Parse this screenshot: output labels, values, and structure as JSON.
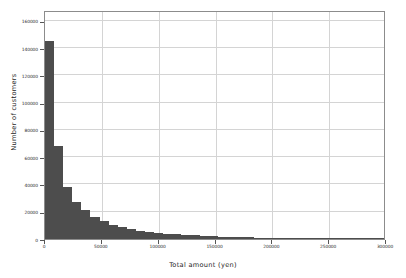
{
  "chart_data": {
    "type": "bar",
    "title": "",
    "subtitle": "",
    "xlabel": "Total amount (yen)",
    "ylabel": "Number of customers",
    "xlim": [
      0,
      300000
    ],
    "ylim": [
      0,
      168000
    ],
    "grid": true,
    "legend": null,
    "bar_color": "#4d4d4d",
    "bin_width": 8000,
    "xticks": [
      0,
      50000,
      100000,
      150000,
      200000,
      250000,
      300000
    ],
    "xticklabels": [
      "0",
      "50000",
      "100000",
      "150000",
      "200000",
      "250000",
      "300000"
    ],
    "yticks": [
      0,
      20000,
      40000,
      60000,
      80000,
      100000,
      120000,
      140000,
      160000
    ],
    "yticklabels": [
      "0",
      "20000",
      "40000",
      "60000",
      "80000",
      "100000",
      "120000",
      "140000",
      "160000"
    ],
    "bin_edges": [
      0,
      8000,
      16000,
      24000,
      32000,
      40000,
      48000,
      56000,
      64000,
      72000,
      80000,
      88000,
      96000,
      104000,
      112000,
      120000,
      128000,
      136000,
      144000,
      152000,
      160000,
      168000,
      176000,
      184000,
      192000,
      200000,
      208000,
      216000,
      224000,
      232000,
      240000,
      248000,
      256000,
      264000,
      272000,
      280000,
      288000,
      296000,
      304000
    ],
    "values": [
      145000,
      68500,
      38000,
      27500,
      21500,
      16500,
      13000,
      10500,
      8500,
      7000,
      6000,
      5200,
      4500,
      3900,
      3400,
      3000,
      2600,
      2300,
      2000,
      1800,
      1600,
      1400,
      1250,
      1100,
      1000,
      900,
      800,
      720,
      650,
      580,
      520,
      470,
      420,
      380,
      340,
      300,
      270,
      240
    ],
    "x": [
      4000,
      12000,
      20000,
      28000,
      36000,
      44000,
      52000,
      60000,
      68000,
      76000,
      84000,
      92000,
      100000,
      108000,
      116000,
      124000,
      132000,
      140000,
      148000,
      156000,
      164000,
      172000,
      180000,
      188000,
      196000,
      204000,
      212000,
      220000,
      228000,
      236000,
      244000,
      252000,
      260000,
      268000,
      276000,
      284000,
      292000,
      300000
    ]
  }
}
